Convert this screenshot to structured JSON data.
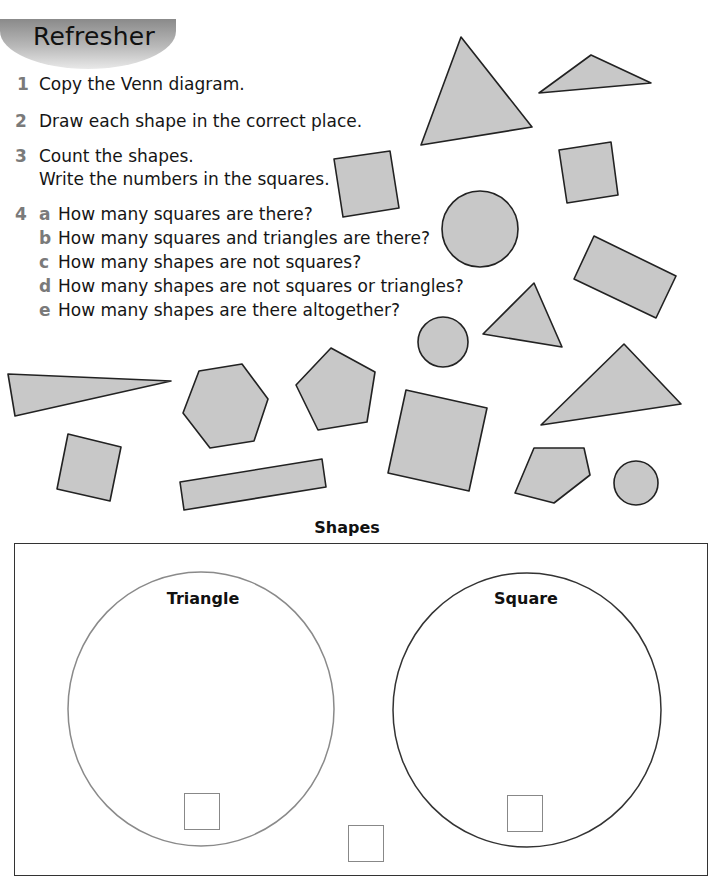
{
  "banner": {
    "title": "Refresher"
  },
  "questions": [
    {
      "number": "1",
      "lines": [
        "Copy the Venn diagram."
      ]
    },
    {
      "number": "2",
      "lines": [
        "Draw each shape in the correct place."
      ]
    },
    {
      "number": "3",
      "lines": [
        "Count the shapes.",
        "Write the numbers in the squares."
      ]
    },
    {
      "number": "4",
      "parts": [
        {
          "letter": "a",
          "text": "How many squares are there?"
        },
        {
          "letter": "b",
          "text": "How many squares and triangles are there?"
        },
        {
          "letter": "c",
          "text": "How many shapes are not squares?"
        },
        {
          "letter": "d",
          "text": "How many shapes are not squares or triangles?"
        },
        {
          "letter": "e",
          "text": "How many shapes are there altogether?"
        }
      ]
    }
  ],
  "shapes_colors": {
    "fill": "#c8c8c8",
    "stroke": "#222222"
  },
  "shapes": [
    {
      "type": "triangle",
      "points": "461,37 532,127 421,145"
    },
    {
      "type": "triangle",
      "points": "539,93 591,55 651,83"
    },
    {
      "type": "square",
      "points": "334,159 390,151 399,208 343,217"
    },
    {
      "type": "square",
      "points": "559,150 611,142 618,195 567,203"
    },
    {
      "type": "circle",
      "cx": 480,
      "cy": 229,
      "r": 38
    },
    {
      "type": "rectangle",
      "points": "594,236 676,276 656,318 574,279"
    },
    {
      "type": "triangle",
      "points": "483,334 534,283 562,347"
    },
    {
      "type": "circle",
      "cx": 443,
      "cy": 342,
      "r": 25
    },
    {
      "type": "triangle",
      "points": "8,374 171,381 15,416"
    },
    {
      "type": "hexagon",
      "points": "199,371 242,364 268,399 254,441 210,448 183,413"
    },
    {
      "type": "pentagon",
      "points": "296,385 331,348 375,372 367,422 318,430"
    },
    {
      "type": "square",
      "points": "406,390 487,408 469,491 388,473"
    },
    {
      "type": "triangle",
      "points": "541,425 624,344 681,404"
    },
    {
      "type": "square",
      "points": "68,434 121,447 110,501 57,489"
    },
    {
      "type": "rectangle",
      "points": "180,482 322,459 326,487 184,510"
    },
    {
      "type": "pentagon",
      "points": "534,448 584,448 590,475 554,503 515,493"
    },
    {
      "type": "circle",
      "cx": 636,
      "cy": 483,
      "r": 22
    }
  ],
  "venn": {
    "title": "Shapes",
    "sets": [
      {
        "label": "Triangle",
        "stroke": "#8a8a8a"
      },
      {
        "label": "Square",
        "stroke": "#333333"
      }
    ],
    "count_boxes": [
      "triangle-count",
      "square-count",
      "outside-count"
    ]
  }
}
